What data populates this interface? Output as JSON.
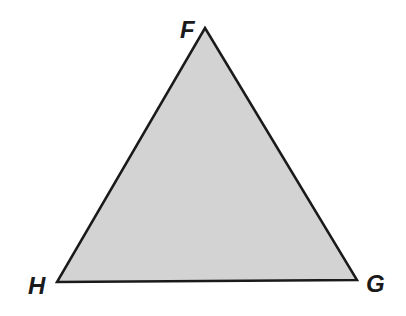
{
  "diagram": {
    "type": "triangle",
    "fill_color": "#d3d3d3",
    "stroke_color": "#1a1a1a",
    "vertices": [
      {
        "label": "F",
        "x": 205,
        "y": 28,
        "label_x": 180,
        "label_y": 38
      },
      {
        "label": "G",
        "x": 357,
        "y": 280,
        "label_x": 366,
        "label_y": 292
      },
      {
        "label": "H",
        "x": 57,
        "y": 282,
        "label_x": 28,
        "label_y": 294
      }
    ]
  }
}
